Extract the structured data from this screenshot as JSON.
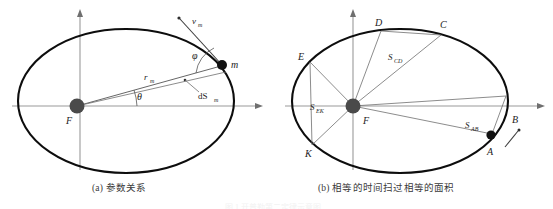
{
  "figure": {
    "title_hidden_strip": "图 1  开普勒第二定律示意图",
    "background_color": "#ffffff",
    "orbit_color": "#0d0d0d",
    "axis_color": "#9a9a9a",
    "ray_color": "#6e6e6e",
    "focus_color": "#4a4a4a",
    "mass_color": "#111111"
  },
  "panel_a": {
    "caption": "(a) 参数关系",
    "focus_label": "F",
    "mass_label": "m",
    "radius_label": "r",
    "radius_sub": "m",
    "velocity_label": "v",
    "velocity_sub": "m",
    "area_label": "dS",
    "area_sub": "m",
    "theta_label": "θ",
    "phi_label": "φ"
  },
  "panel_b": {
    "caption": "(b) 相等的时间扫过相等的面积",
    "focus_label": "F",
    "points": [
      "A",
      "B",
      "C",
      "D",
      "E",
      "K"
    ],
    "areas": [
      {
        "label": "S",
        "sub": "AB"
      },
      {
        "label": "S",
        "sub": "CD"
      },
      {
        "label": "S",
        "sub": "EK"
      }
    ],
    "moving_point": "A",
    "apoapsis_point": "B"
  }
}
